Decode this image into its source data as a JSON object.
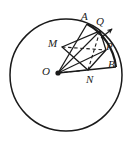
{
  "figure": {
    "type": "geometry-diagram",
    "background_color": "#ffffff",
    "stroke_color": "#1a1a1a",
    "labels": [
      {
        "id": "A",
        "text": "A",
        "x": 81,
        "y": 11
      },
      {
        "id": "Q",
        "text": "Q",
        "x": 96,
        "y": 16
      },
      {
        "id": "P",
        "text": "P",
        "x": 106,
        "y": 41
      },
      {
        "id": "B",
        "text": "B",
        "x": 108,
        "y": 59
      },
      {
        "id": "M",
        "text": "M",
        "x": 48,
        "y": 38
      },
      {
        "id": "N",
        "text": "N",
        "x": 86,
        "y": 74
      },
      {
        "id": "O",
        "text": "O",
        "x": 42,
        "y": 66
      }
    ],
    "circle": {
      "cx": 66,
      "cy": 75,
      "r": 56
    },
    "center_point": {
      "cx": 58,
      "cy": 73,
      "r": 2.6
    },
    "points": {
      "O": {
        "x": 58,
        "y": 73
      },
      "A": {
        "x": 87,
        "y": 24
      },
      "Q": {
        "x": 100,
        "y": 31
      },
      "P": {
        "x": 106,
        "y": 50
      },
      "B": {
        "x": 114,
        "y": 66
      },
      "M": {
        "x": 62,
        "y": 47
      },
      "N": {
        "x": 88,
        "y": 70
      }
    },
    "solid_segments": [
      {
        "name": "radius-OA",
        "from": "O",
        "to": "A"
      },
      {
        "name": "radius-OQ",
        "from": "O",
        "to": "Q"
      },
      {
        "name": "radius-OP",
        "from": "O",
        "to": "P"
      },
      {
        "name": "radius-OB",
        "from": "O",
        "to": "B"
      },
      {
        "name": "side-MQ",
        "from": "M",
        "to": "Q"
      },
      {
        "name": "side-QP",
        "from": "Q",
        "to": "P"
      },
      {
        "name": "side-PN",
        "from": "P",
        "to": "N"
      },
      {
        "name": "side-NM",
        "from": "N",
        "to": "M"
      }
    ],
    "dashed_segments": [
      {
        "name": "diagonal-MP",
        "from": "M",
        "to": "P"
      },
      {
        "name": "diagonal-NQ",
        "from": "N",
        "to": "Q"
      },
      {
        "name": "diagonal-ON",
        "from": "O",
        "to": "N"
      }
    ],
    "arc_AB": {
      "name": "arc-A-to-B",
      "from": "A",
      "to": "B"
    },
    "arrow": {
      "name": "motion-arrow",
      "x1": 101,
      "y1": 38,
      "x2": 113,
      "y2": 28,
      "direction": "tangential-outward"
    }
  }
}
